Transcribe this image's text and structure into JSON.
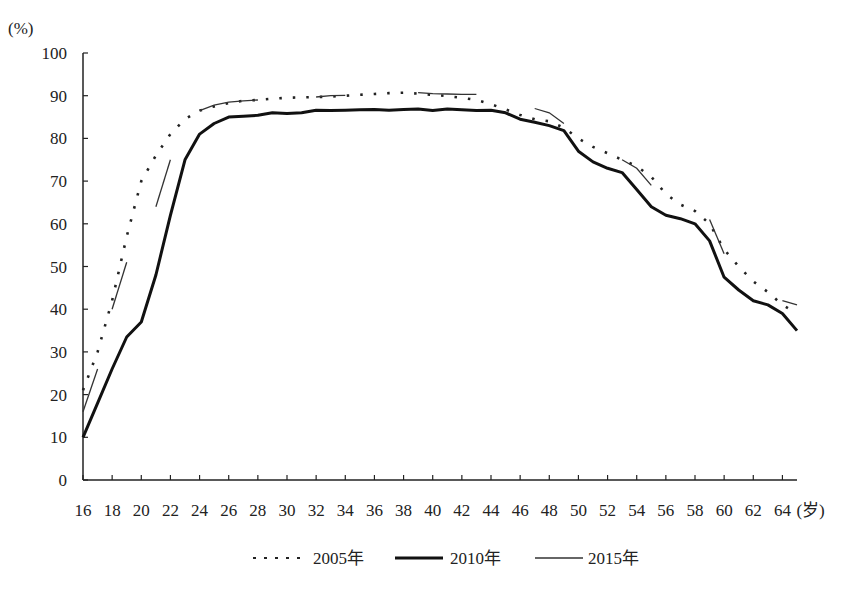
{
  "chart_data": {
    "type": "line",
    "title": "",
    "ylabel": "(%)",
    "xlabel": "(岁)",
    "ylim": [
      0,
      100
    ],
    "xlim": [
      16,
      65
    ],
    "yticks": [
      0,
      10,
      20,
      30,
      40,
      50,
      60,
      70,
      80,
      90,
      100
    ],
    "xticks": [
      16,
      18,
      20,
      22,
      24,
      26,
      28,
      30,
      32,
      34,
      36,
      38,
      40,
      42,
      44,
      46,
      48,
      50,
      52,
      54,
      56,
      58,
      60,
      62,
      64
    ],
    "grid": false,
    "legend_position": "bottom",
    "series": [
      {
        "name": "2005年",
        "style": "dotted",
        "x": [
          16,
          17,
          18,
          19,
          20,
          21,
          22,
          23,
          24,
          25,
          26,
          27,
          28,
          29,
          30,
          31,
          32,
          33,
          34,
          35,
          36,
          37,
          38,
          39,
          40,
          41,
          42,
          43,
          44,
          45,
          46,
          47,
          48,
          49,
          50,
          51,
          52,
          53,
          54,
          55,
          56,
          57,
          58,
          59,
          60,
          61,
          62,
          63,
          64,
          65
        ],
        "values": [
          21,
          30,
          42,
          57,
          70,
          76,
          81,
          84.5,
          86.5,
          87.5,
          88.3,
          88.8,
          89,
          89.3,
          89.5,
          89.6,
          89.7,
          89.8,
          90,
          90.2,
          90.4,
          90.6,
          90.7,
          90.5,
          90.2,
          89.9,
          89.5,
          89,
          88,
          86.8,
          85.5,
          84.5,
          84,
          82.5,
          80,
          78,
          76.5,
          75,
          73.5,
          71,
          67,
          64.5,
          63,
          60,
          54,
          50,
          46.5,
          44,
          41,
          39
        ]
      },
      {
        "name": "2010年",
        "style": "solid-thick",
        "x": [
          16,
          17,
          18,
          19,
          20,
          21,
          22,
          23,
          24,
          25,
          26,
          27,
          28,
          29,
          30,
          31,
          32,
          33,
          34,
          35,
          36,
          37,
          38,
          39,
          40,
          41,
          42,
          43,
          44,
          45,
          46,
          47,
          48,
          49,
          50,
          51,
          52,
          53,
          54,
          55,
          56,
          57,
          58,
          59,
          60,
          61,
          62,
          63,
          64,
          65
        ],
        "values": [
          10,
          18,
          26,
          33.5,
          37,
          48,
          62,
          75,
          81,
          83.5,
          85,
          85.2,
          85.4,
          86,
          85.8,
          86,
          86.6,
          86.5,
          86.6,
          86.7,
          86.8,
          86.6,
          86.8,
          86.9,
          86.5,
          86.9,
          86.7,
          86.5,
          86.6,
          86,
          84.5,
          83.8,
          83,
          81.8,
          77,
          74.5,
          73,
          72,
          68,
          64,
          62,
          61.2,
          60,
          56,
          47.5,
          44.5,
          42,
          41,
          39,
          35
        ]
      },
      {
        "name": "2015年",
        "style": "solid-thin-segments",
        "segments": [
          {
            "x": [
              16,
              17
            ],
            "values": [
              16,
              26
            ]
          },
          {
            "x": [
              18,
              19
            ],
            "values": [
              40,
              51
            ]
          },
          {
            "x": [
              21,
              22
            ],
            "values": [
              64,
              75
            ]
          },
          {
            "x": [
              24,
              25,
              26,
              27,
              28
            ],
            "values": [
              86.5,
              87.8,
              88.5,
              88.8,
              89
            ]
          },
          {
            "x": [
              32,
              33,
              34
            ],
            "values": [
              89.7,
              90,
              90.1
            ]
          },
          {
            "x": [
              39,
              40,
              41,
              42,
              43
            ],
            "values": [
              90.7,
              90.5,
              90.4,
              90.3,
              90.3
            ]
          },
          {
            "x": [
              47,
              48,
              49
            ],
            "values": [
              87,
              86,
              83.5
            ]
          },
          {
            "x": [
              53,
              54,
              55
            ],
            "values": [
              75,
              73,
              69
            ]
          },
          {
            "x": [
              59,
              60
            ],
            "values": [
              61,
              53
            ]
          },
          {
            "x": [
              64,
              65
            ],
            "values": [
              42,
              41
            ]
          }
        ]
      }
    ]
  },
  "legend": {
    "items": [
      {
        "label": "2005年",
        "style": "dotted"
      },
      {
        "label": "2010年",
        "style": "solid-thick"
      },
      {
        "label": "2015年",
        "style": "solid-thin"
      }
    ]
  },
  "axis": {
    "y_unit": "(%)",
    "x_unit": "(岁)"
  }
}
